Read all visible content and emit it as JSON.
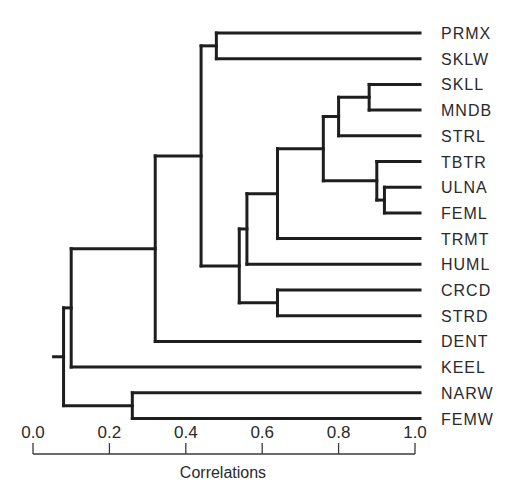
{
  "chart_data": {
    "type": "dendrogram",
    "title": "",
    "xlabel": "Correlations",
    "ylabel": "",
    "xlim": [
      0.0,
      1.0
    ],
    "x_ticks": [
      "0.0",
      "0.2",
      "0.4",
      "0.6",
      "0.8",
      "1.0"
    ],
    "grid": false,
    "leaves": [
      "PRMX",
      "SKLW",
      "SKLL",
      "MNDB",
      "STRL",
      "TBTR",
      "ULNA",
      "FEML",
      "TRMT",
      "HUML",
      "CRCD",
      "STRD",
      "DENT",
      "KEEL",
      "NARW",
      "FEMW"
    ],
    "merges": [
      {
        "id": "n1",
        "children": [
          "ULNA",
          "FEML"
        ],
        "correlation": 0.92
      },
      {
        "id": "n2",
        "children": [
          "TBTR",
          "n1"
        ],
        "correlation": 0.9
      },
      {
        "id": "n3",
        "children": [
          "SKLL",
          "MNDB"
        ],
        "correlation": 0.88
      },
      {
        "id": "n4",
        "children": [
          "n3",
          "STRL"
        ],
        "correlation": 0.8
      },
      {
        "id": "n5",
        "children": [
          "n4",
          "n2"
        ],
        "correlation": 0.76
      },
      {
        "id": "n6",
        "children": [
          "n5",
          "TRMT"
        ],
        "correlation": 0.64
      },
      {
        "id": "n7",
        "children": [
          "CRCD",
          "STRD"
        ],
        "correlation": 0.64
      },
      {
        "id": "n8",
        "children": [
          "n6",
          "HUML"
        ],
        "correlation": 0.56
      },
      {
        "id": "n9",
        "children": [
          "n8",
          "n7"
        ],
        "correlation": 0.54
      },
      {
        "id": "n10",
        "children": [
          "PRMX",
          "SKLW"
        ],
        "correlation": 0.48
      },
      {
        "id": "n11",
        "children": [
          "n10",
          "n9"
        ],
        "correlation": 0.44
      },
      {
        "id": "n12",
        "children": [
          "n11",
          "DENT"
        ],
        "correlation": 0.32
      },
      {
        "id": "n13",
        "children": [
          "NARW",
          "FEMW"
        ],
        "correlation": 0.26
      },
      {
        "id": "n14",
        "children": [
          "n12",
          "KEEL"
        ],
        "correlation": 0.1
      },
      {
        "id": "n15",
        "children": [
          "n14",
          "n13"
        ],
        "correlation": 0.08
      }
    ]
  },
  "colors": {
    "line": "#1e1e1e",
    "text": "#2a2a2a",
    "background": "#ffffff"
  }
}
